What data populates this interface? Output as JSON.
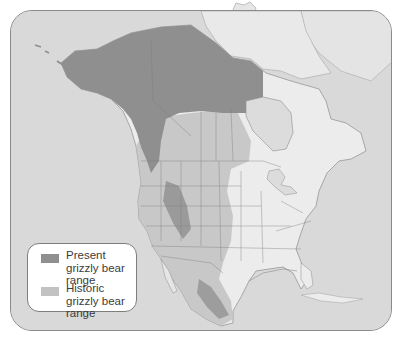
{
  "map": {
    "subject": "North America",
    "colors": {
      "ocean": "#d9d9d9",
      "land": "#ececec",
      "present_range": "#8f8f8f",
      "historic_range": "#c2c2c2",
      "borders": "#8c8c8c",
      "frame_border": "#8a8a8a"
    }
  },
  "legend": {
    "items": [
      {
        "label": "Present grizzly bear range",
        "color": "#8f8f8f"
      },
      {
        "label": "Historic grizzly bear range",
        "color": "#c2c2c2"
      }
    ]
  }
}
